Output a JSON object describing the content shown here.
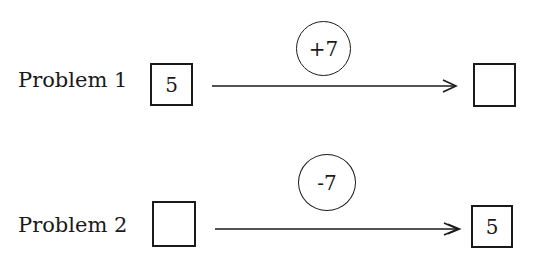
{
  "problems": [
    {
      "label": "Problem 1",
      "start_value": "5",
      "operator": "+7",
      "end_value": ""
    },
    {
      "label": "Problem 2",
      "start_value": "",
      "operator": "-7",
      "end_value": "5"
    }
  ],
  "colors": {
    "ink": "#1a1a1a",
    "background": "#ffffff"
  }
}
